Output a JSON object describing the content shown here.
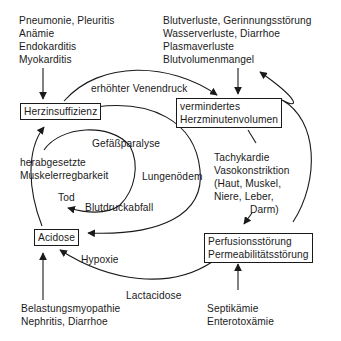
{
  "diagram": {
    "type": "causal-cycle",
    "nodes": {
      "herzinsuffizienz": {
        "label": "Herzinsuffizienz"
      },
      "hmv": {
        "lines": [
          "vermindertes",
          "Herzminutenvolumen"
        ]
      },
      "perfusion": {
        "lines": [
          "Perfusionsstörung",
          "Permeabilitätsstörung"
        ]
      },
      "acidose": {
        "label": "Acidose"
      }
    },
    "causes": {
      "top_left": [
        "Pneumonie, Pleuritis",
        "Anämie",
        "Endokarditis",
        "Myokarditis"
      ],
      "top_right": [
        "Blutverluste, Gerinnungsstörung",
        "Wasserverluste, Diarrhoe",
        "Plasmaverluste",
        "Blutvolumenmangel"
      ],
      "bottom_left": [
        "Belastungsmyopathie",
        "Nephritis, Diarrhoe"
      ],
      "bottom_right": [
        "Septikämie",
        "Enterotoxämie"
      ]
    },
    "edge_labels": {
      "venendruck": "erhöhter Venendruck",
      "tachykardie": [
        "Tachykardie",
        "Vasokonstriktion",
        "(Haut, Muskel,",
        "Niere, Leber,",
        "Darm)"
      ],
      "lactacidose": "Lactacidose",
      "hypoxie": "Hypoxie",
      "muskel": [
        "herabgesetzte",
        "Muskelerregbarkeit"
      ],
      "gefaess": "Gefäßparalyse",
      "lungen": "Lungenödem",
      "blutdruck": "Blutdruckabfall",
      "tod": "Tod"
    },
    "edges": [
      {
        "from": "top_left causes",
        "to": "Herzinsuffizienz"
      },
      {
        "from": "Herzinsuffizienz",
        "to": "vermindertes Herzminutenvolumen",
        "label": "erhöhter Venendruck"
      },
      {
        "from": "top_right causes",
        "to": "vermindertes Herzminutenvolumen"
      },
      {
        "from": "vermindertes Herzminutenvolumen",
        "to": "Perfusionsstörung",
        "label": "Tachykardie Vasokonstriktion"
      },
      {
        "from": "Perfusionsstörung",
        "to": "Blutvolumenmangel"
      },
      {
        "from": "bottom_right causes",
        "to": "Perfusionsstörung"
      },
      {
        "from": "Perfusionsstörung",
        "to": "Acidose",
        "label": "Lactacidose"
      },
      {
        "from": "vermindertes Herzminutenvolumen",
        "to": "Acidose",
        "label": "Hypoxie"
      },
      {
        "from": "bottom_left causes",
        "to": "Acidose"
      },
      {
        "from": "Acidose",
        "to": "Herzinsuffizienz",
        "label": "herabgesetzte Muskelerregbarkeit"
      },
      {
        "from": "Herzinsuffizienz",
        "to": "Tod",
        "label": "Gefäßparalyse / Blutdruckabfall"
      }
    ]
  }
}
